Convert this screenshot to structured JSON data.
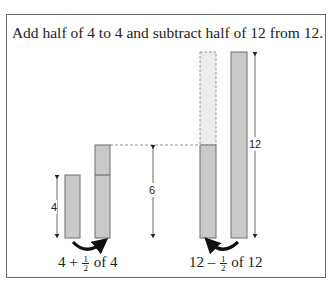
{
  "title": "Add half of 4 to 4 and subtract half of 12 from 12.",
  "colors": {
    "bar_fill": "#c9c9c9",
    "bar_stroke": "#6f6f6f",
    "ghost_fill": "#ececec",
    "arrow": "#111111",
    "frame": "#6a6a6a"
  },
  "left_group": {
    "measure_label": "4",
    "result_measure_label": "6",
    "expression": {
      "prefix": "4 + ",
      "fraction_numerator": "1",
      "fraction_denominator": "2",
      "suffix": " of 4"
    }
  },
  "right_group": {
    "measure_label": "12",
    "expression": {
      "prefix": "12 – ",
      "fraction_numerator": "1",
      "fraction_denominator": "2",
      "suffix": " of 12"
    }
  }
}
